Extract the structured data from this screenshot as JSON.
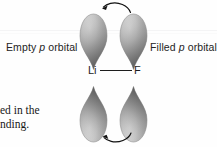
{
  "figure": {
    "title_semantic": "lithium-fluoride p-orbital polarization diagram",
    "background_color": "#fefefe"
  },
  "labels": {
    "empty_orbital": {
      "prefix": "Empty ",
      "italic": "p",
      "suffix": " orbital"
    },
    "filled_orbital": {
      "prefix": "Filled ",
      "italic": "p",
      "suffix": " orbital"
    }
  },
  "molecule": {
    "left_atom": "Li",
    "right_atom": "F",
    "bond_type": "single-bond-line"
  },
  "caption_fragment": {
    "line1": "ed in the",
    "line2": "nding."
  },
  "orbitals": [
    {
      "id": "top-left",
      "atom": "Li",
      "state": "empty",
      "orientation": "point-down"
    },
    {
      "id": "top-right",
      "atom": "F",
      "state": "filled",
      "orientation": "point-down"
    },
    {
      "id": "bottom-left",
      "atom": "Li",
      "state": "empty",
      "orientation": "point-up"
    },
    {
      "id": "bottom-right",
      "atom": "F",
      "state": "filled",
      "orientation": "point-up"
    }
  ],
  "arrows": [
    {
      "id": "top-arrow",
      "direction": "right-to-left",
      "shape": "curved-arc-over"
    },
    {
      "id": "bottom-arrow",
      "direction": "right-to-left",
      "shape": "curved-arc-under"
    }
  ],
  "colors": {
    "orbital_light": "#d8d8d8",
    "orbital_mid": "#a9a9a9",
    "orbital_dark": "#6e6e6e",
    "orbital_edge": "#8a8a8a",
    "text": "#242424",
    "line": "#1d1d1d",
    "rule": "#f4f4f5"
  }
}
